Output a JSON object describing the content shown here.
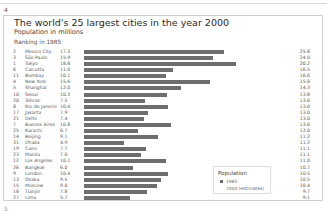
{
  "page": {
    "number_top": "4",
    "number_bottom": "5"
  },
  "header": {
    "title": "The world's 25 largest cities in the year 2000",
    "subtitle": "Population in millions",
    "ranking_label": "Ranking in 1985"
  },
  "legend": {
    "title": "Population",
    "item_1985": "1985",
    "item_2000": "2000 (estimated)",
    "color_1985": "#6e6e6e"
  },
  "rows": [
    {
      "rank": "2",
      "city": "Mexico City",
      "v1985": "17.3",
      "v2000": "25.8"
    },
    {
      "rank": "3",
      "city": "São Paulo",
      "v1985": "15.9",
      "v2000": "24.0"
    },
    {
      "rank": "1",
      "city": "Tokyo",
      "v1985": "18.8",
      "v2000": "20.2"
    },
    {
      "rank": "6",
      "city": "Calcutta",
      "v1985": "11.0",
      "v2000": "16.5"
    },
    {
      "rank": "11",
      "city": "Bombay",
      "v1985": "10.1",
      "v2000": "16.0"
    },
    {
      "rank": "4",
      "city": "New York",
      "v1985": "15.6",
      "v2000": "15.8"
    },
    {
      "rank": "5",
      "city": "Shanghai",
      "v1985": "12.0",
      "v2000": "14.3"
    },
    {
      "rank": "10",
      "city": "Seoul",
      "v1985": "10.3",
      "v2000": "13.8"
    },
    {
      "rank": "20",
      "city": "Tehran",
      "v1985": "7.5",
      "v2000": "13.0"
    },
    {
      "rank": "8",
      "city": "Rio de Janeiro",
      "v1985": "10.4",
      "v2000": "13.0"
    },
    {
      "rank": "17",
      "city": "Jakarta",
      "v1985": "7.9",
      "v2000": "13.0"
    },
    {
      "rank": "21",
      "city": "Delhi",
      "v1985": "7.4",
      "v2000": "13.0"
    },
    {
      "rank": "7",
      "city": "Buenos Aires",
      "v1985": "10.8",
      "v2000": "13.0"
    },
    {
      "rank": "25",
      "city": "Karachi",
      "v1985": "6.7",
      "v2000": "12.0"
    },
    {
      "rank": "14",
      "city": "Beijing",
      "v1985": "9.1",
      "v2000": "11.2"
    },
    {
      "rank": "31",
      "city": "Dhaka",
      "v1985": "4.9",
      "v2000": "11.2"
    },
    {
      "rank": "19",
      "city": "Cairo",
      "v1985": "7.7",
      "v2000": "11.1"
    },
    {
      "rank": "23",
      "city": "Manila",
      "v1985": "7.0",
      "v2000": "11.1"
    },
    {
      "rank": "12",
      "city": "Los Angeles",
      "v1985": "10.1",
      "v2000": "11.0"
    },
    {
      "rank": "26",
      "city": "Bangkok",
      "v1985": "6.0",
      "v2000": "10.7"
    },
    {
      "rank": "9",
      "city": "London",
      "v1985": "10.4",
      "v2000": "10.5"
    },
    {
      "rank": "13",
      "city": "Osaka",
      "v1985": "9.5",
      "v2000": "10.5"
    },
    {
      "rank": "15",
      "city": "Moscow",
      "v1985": "9.0",
      "v2000": "10.4"
    },
    {
      "rank": "18",
      "city": "Tianjin",
      "v1985": "7.8",
      "v2000": "9.7"
    },
    {
      "rank": "27",
      "city": "Lima",
      "v1985": "5.7",
      "v2000": "9.1"
    }
  ],
  "chart_data": {
    "type": "bar",
    "orientation": "horizontal",
    "title": "The world's 25 largest cities in the year 2000",
    "subtitle": "Population in millions",
    "xlabel": "",
    "ylabel": "Ranking in 1985",
    "grid": false,
    "legend_position": "lower right",
    "categories": [
      "Mexico City",
      "São Paulo",
      "Tokyo",
      "Calcutta",
      "Bombay",
      "New York",
      "Shanghai",
      "Seoul",
      "Tehran",
      "Rio de Janeiro",
      "Jakarta",
      "Delhi",
      "Buenos Aires",
      "Karachi",
      "Beijing",
      "Dhaka",
      "Cairo",
      "Manila",
      "Los Angeles",
      "Bangkok",
      "London",
      "Osaka",
      "Moscow",
      "Tianjin",
      "Lima"
    ],
    "rank_1985": [
      2,
      3,
      1,
      6,
      11,
      4,
      5,
      10,
      20,
      8,
      17,
      21,
      7,
      25,
      14,
      31,
      19,
      23,
      12,
      26,
      9,
      13,
      15,
      18,
      27
    ],
    "series": [
      {
        "name": "1985",
        "values": [
          17.3,
          15.9,
          18.8,
          11.0,
          10.1,
          15.6,
          12.0,
          10.3,
          7.5,
          10.4,
          7.9,
          7.4,
          10.8,
          6.7,
          9.1,
          4.9,
          7.7,
          7.0,
          10.1,
          6.0,
          10.4,
          9.5,
          9.0,
          7.8,
          5.7
        ]
      },
      {
        "name": "2000 (estimated)",
        "values": [
          25.8,
          24.0,
          20.2,
          16.5,
          16.0,
          15.8,
          14.3,
          13.8,
          13.0,
          13.0,
          13.0,
          13.0,
          13.0,
          12.0,
          11.2,
          11.2,
          11.1,
          11.1,
          11.0,
          10.7,
          10.5,
          10.5,
          10.4,
          9.7,
          9.1
        ]
      }
    ]
  }
}
